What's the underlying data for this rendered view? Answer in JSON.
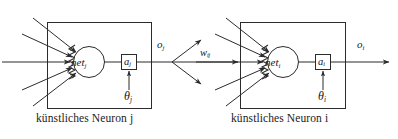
{
  "figure": {
    "background": "#ffffff",
    "stroke": "#2b2b2b",
    "text_color": "#1b1b1b",
    "width": 398,
    "height": 139
  },
  "neuron_j": {
    "caption": "künstliches Neuron j",
    "net_label": "net",
    "net_sub": "j",
    "activation_label": "a",
    "activation_sub": "j",
    "threshold_label": "θ",
    "threshold_sub": "j",
    "output_label": "o",
    "output_sub": "j",
    "input_count": 5
  },
  "neuron_i": {
    "caption": "künstliches Neuron i",
    "net_label": "net",
    "net_sub": "i",
    "activation_label": "a",
    "activation_sub": "i",
    "threshold_label": "θ",
    "threshold_sub": "i",
    "output_label": "o",
    "output_sub": "i",
    "input_count": 5
  },
  "connection": {
    "weight_label": "w",
    "weight_sub": "ij",
    "branch_count": 3
  }
}
